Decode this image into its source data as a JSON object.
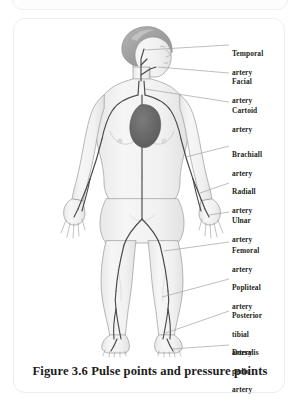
{
  "figure": {
    "caption": "Figure 3.6 Pulse points and pressure points",
    "colors": {
      "body_fill": "#f2f2f2",
      "body_outline": "#9a9a9a",
      "hair": "#a9a9a9",
      "hair_highlight": "#c4c4c4",
      "artery": "#4a4a4a",
      "heart": "#6b6b6b",
      "leader_line": "#9b9b9b",
      "card_border": "#ededed",
      "text": "#231f20"
    }
  },
  "labels": [
    {
      "id": "temporal",
      "line1": "Temporal",
      "line2": "artery",
      "line3": ""
    },
    {
      "id": "facial",
      "line1": "Facial",
      "line2": "artery",
      "line3": ""
    },
    {
      "id": "cartoid",
      "line1": "Cartoid",
      "line2": "artery",
      "line3": ""
    },
    {
      "id": "brachiall",
      "line1": "Brachiall",
      "line2": "artery",
      "line3": ""
    },
    {
      "id": "radiall",
      "line1": "Radiall",
      "line2": "artery",
      "line3": ""
    },
    {
      "id": "ulnar",
      "line1": "Ulnar",
      "line2": "artery",
      "line3": ""
    },
    {
      "id": "femoral",
      "line1": "Femoral",
      "line2": "artery",
      "line3": ""
    },
    {
      "id": "popliteal",
      "line1": "Popliteal",
      "line2": "artery",
      "line3": ""
    },
    {
      "id": "posterior-tibial",
      "line1": "Posterior",
      "line2": "tibial",
      "line3": "artery"
    },
    {
      "id": "dorsalis-pedis",
      "line1": "Dorsalis",
      "line2": "pedis",
      "line3": "artery"
    }
  ]
}
